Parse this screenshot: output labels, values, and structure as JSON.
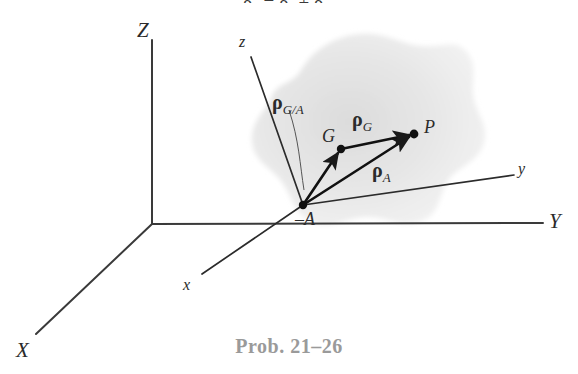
{
  "figure": {
    "caption": "Prob. 21–26",
    "top_equation_fragment": "ρ₀ = ρₐ + ρₘ",
    "body_label": "rigid-body-blob",
    "colors": {
      "ink": "#2b2b2b",
      "caption": "#9a9a9a",
      "body_fill": "#e8e8e8",
      "background": "#ffffff"
    }
  },
  "global_frame": {
    "origin": {
      "x": 152,
      "y": 224
    },
    "axes": [
      {
        "name": "Z",
        "label": "Z",
        "label_x": 137,
        "label_y": 18,
        "end_x": 152,
        "end_y": 40
      },
      {
        "name": "Y",
        "label": "Y",
        "label_x": 549,
        "label_y": 209,
        "end_x": 543,
        "end_y": 223
      },
      {
        "name": "X",
        "label": "X",
        "label_x": 16,
        "label_y": 338,
        "end_x": 36,
        "end_y": 334
      }
    ]
  },
  "local_frame": {
    "origin_point": "A",
    "origin": {
      "x": 303,
      "y": 205
    },
    "axes": [
      {
        "name": "z",
        "label": "z",
        "label_x": 239,
        "label_y": 33,
        "end_x": 251,
        "end_y": 57
      },
      {
        "name": "y",
        "label": "y",
        "label_x": 518,
        "label_y": 160,
        "end_x": 514,
        "end_y": 175
      },
      {
        "name": "x",
        "label": "x",
        "label_x": 183,
        "label_y": 276,
        "end_x": 202,
        "end_y": 274
      }
    ]
  },
  "points": [
    {
      "name": "A",
      "label": "–A",
      "x": 303,
      "y": 205,
      "label_x": 295,
      "label_y": 209,
      "dot": true
    },
    {
      "name": "G",
      "label": "G",
      "x": 341,
      "y": 149,
      "label_x": 322,
      "label_y": 126,
      "dot": true
    },
    {
      "name": "P",
      "label": "P",
      "x": 414,
      "y": 134,
      "label_x": 424,
      "label_y": 117,
      "dot": true
    }
  ],
  "vectors": [
    {
      "name": "rho-G-over-A",
      "symbol": "ρ",
      "subscript": "G/A",
      "from": "A",
      "to": "G",
      "x1": 303,
      "y1": 205,
      "x2": 341,
      "y2": 149,
      "label_x": 272,
      "label_y": 91
    },
    {
      "name": "rho-G",
      "symbol": "ρ",
      "subscript": "G",
      "from": "G",
      "to": "P",
      "x1": 341,
      "y1": 149,
      "x2": 414,
      "y2": 134,
      "label_x": 352,
      "label_y": 108
    },
    {
      "name": "rho-A",
      "symbol": "ρ",
      "subscript": "A",
      "from": "A",
      "to": "P",
      "x1": 303,
      "y1": 205,
      "x2": 414,
      "y2": 134,
      "label_x": 372,
      "label_y": 159
    }
  ],
  "leader_line": {
    "name": "rho-G-over-A-leader",
    "path": "M 289 110 C 299 140 300 165 304 190"
  }
}
